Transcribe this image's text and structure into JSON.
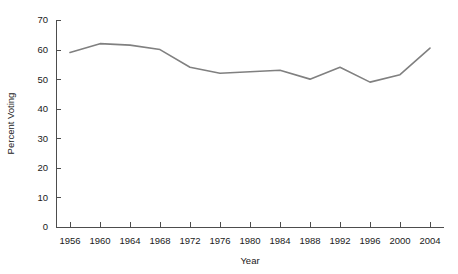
{
  "chart_data": {
    "type": "line",
    "title": "",
    "xlabel": "Year",
    "ylabel": "Percent Voting",
    "x": [
      1956,
      1960,
      1964,
      1968,
      1972,
      1976,
      1980,
      1984,
      1988,
      1992,
      1996,
      2000,
      2004
    ],
    "values": [
      59.0,
      62.0,
      61.5,
      60.0,
      54.0,
      52.0,
      52.5,
      53.0,
      50.0,
      54.0,
      49.0,
      51.5,
      60.5
    ],
    "series": [
      {
        "name": "Percent Voting",
        "values": [
          59.0,
          62.0,
          61.5,
          60.0,
          54.0,
          52.0,
          52.5,
          53.0,
          50.0,
          54.0,
          49.0,
          51.5,
          60.5
        ]
      }
    ],
    "xlim": [
      1954,
      2006
    ],
    "ylim": [
      0,
      70
    ],
    "xticks": [
      1956,
      1960,
      1964,
      1968,
      1972,
      1976,
      1980,
      1984,
      1988,
      1992,
      1996,
      2000,
      2004
    ],
    "xtick_labels": [
      "1956",
      "1960",
      "1964",
      "1968",
      "1972",
      "1976",
      "1980",
      "1984",
      "1988",
      "1992",
      "1996",
      "2000",
      "2004"
    ],
    "yticks": [
      0,
      10,
      20,
      30,
      40,
      50,
      60,
      70
    ],
    "ytick_labels": [
      "0",
      "10",
      "20",
      "30",
      "40",
      "50",
      "60",
      "70"
    ],
    "grid": false,
    "legend": false,
    "legend_position": "none",
    "line_color": "#808080",
    "axis_color": "#4d4d4d",
    "text_color": "#1a1a1a",
    "background_color": "#ffffff"
  }
}
